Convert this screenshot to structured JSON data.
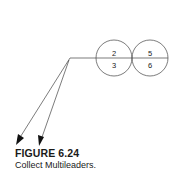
{
  "figure": {
    "title": "FIGURE 6.24",
    "caption": "Collect Multileaders."
  },
  "balloons": [
    {
      "top": "2",
      "bottom": "3"
    },
    {
      "top": "5",
      "bottom": "6"
    }
  ],
  "colors": {
    "line": "#333333",
    "text": "#1a1a1a"
  }
}
